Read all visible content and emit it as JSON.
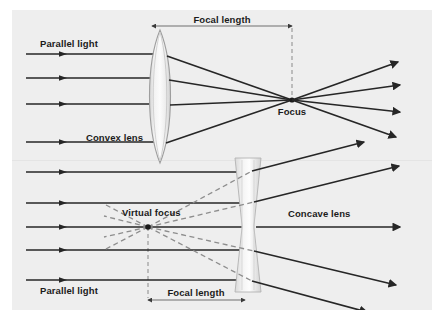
{
  "figure": {
    "background_color": "#ffffff",
    "panel_color": "#eeeeee",
    "ray_color": "#262626",
    "dashed_color": "#8a8a8a",
    "lens_fill": "#e2e2e2",
    "lens_stroke": "#9a9a9a",
    "text_color": "#1b1b1b",
    "width": 443,
    "height": 327
  },
  "panels": [
    {
      "id": "convex-panel",
      "lens_type": "convex",
      "labels": {
        "parallel_light": "Parallel light",
        "focal_length": "Focal length",
        "lens_name": "Convex lens",
        "focus": "Focus"
      },
      "geometry": {
        "lens_center_x": 160,
        "lens_top_y": 30,
        "lens_bottom_y": 163,
        "focus_x": 292,
        "focus_y": 100,
        "focal_length_y": 26,
        "ray_start_x": 26,
        "ray_end_x": 400,
        "incoming_ray_y": [
          54,
          78,
          104,
          142
        ],
        "marker_x": 63
      }
    },
    {
      "id": "concave-panel",
      "lens_type": "concave",
      "labels": {
        "parallel_light": "Parallel light",
        "focal_length": "Focal length",
        "lens_name": "Concave lens",
        "virtual_focus": "Virtual focus"
      },
      "geometry": {
        "lens_center_x": 248,
        "lens_top_y": 158,
        "lens_bottom_y": 292,
        "virtual_focus_x": 148,
        "virtual_focus_y": 227,
        "focal_length_y": 300,
        "ray_start_x": 26,
        "ray_end_x": 400,
        "incoming_ray_y": [
          172,
          203,
          227,
          250,
          280
        ],
        "marker_x": 63
      }
    }
  ],
  "icons": {
    "arrowhead": "solid-triangle",
    "dimension_tick": "double-arrow"
  }
}
